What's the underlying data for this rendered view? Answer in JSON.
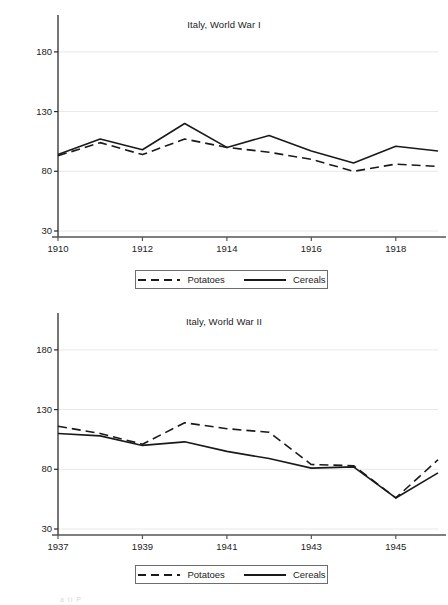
{
  "figure": {
    "background_color": "#ffffff",
    "line_color": "#1a1a1a",
    "grid_color": "#e8e8e8",
    "axis_color": "#555555",
    "footer_artifact": "a    ti    P"
  },
  "legend": {
    "series": [
      {
        "name": "Potatoes",
        "style": "dashed"
      },
      {
        "name": "Cereals",
        "style": "solid"
      }
    ]
  },
  "chart_data": [
    {
      "id": "italy-world-war-1",
      "type": "line",
      "title": "Italy, World War I",
      "xlabel": "",
      "ylabel": "",
      "xlim": [
        1910,
        1919
      ],
      "ylim": [
        30,
        200
      ],
      "yticks": [
        30,
        80,
        130,
        180
      ],
      "ytick_labels": [
        "30",
        "80",
        "130",
        "180"
      ],
      "xticks": [
        1910,
        1912,
        1914,
        1916,
        1918
      ],
      "xtick_labels": [
        "1910",
        "1912",
        "1914",
        "1916",
        "1918"
      ],
      "x": [
        1910,
        1911,
        1912,
        1913,
        1914,
        1915,
        1916,
        1917,
        1918,
        1919
      ],
      "grid": "horizontal",
      "legend_position": "below",
      "series": [
        {
          "name": "Potatoes",
          "style": "dashed",
          "values": [
            93,
            104,
            94,
            107,
            100,
            96,
            90,
            80,
            86,
            84
          ]
        },
        {
          "name": "Cereals",
          "style": "solid",
          "values": [
            94,
            107,
            98,
            120,
            100,
            110,
            97,
            87,
            101,
            97
          ]
        }
      ]
    },
    {
      "id": "italy-world-war-2",
      "type": "line",
      "title": "Italy, World War II",
      "xlabel": "",
      "ylabel": "",
      "xlim": [
        1937,
        1946
      ],
      "ylim": [
        30,
        200
      ],
      "yticks": [
        30,
        80,
        130,
        180
      ],
      "ytick_labels": [
        "30",
        "80",
        "130",
        "180"
      ],
      "xticks": [
        1937,
        1939,
        1941,
        1943,
        1945
      ],
      "xtick_labels": [
        "1937",
        "1939",
        "1941",
        "1943",
        "1945"
      ],
      "x": [
        1937,
        1938,
        1939,
        1940,
        1941,
        1942,
        1943,
        1944,
        1945,
        1946
      ],
      "grid": "horizontal",
      "legend_position": "below",
      "series": [
        {
          "name": "Potatoes",
          "style": "dashed",
          "values": [
            116,
            110,
            101,
            119,
            114,
            111,
            84,
            83,
            56,
            88
          ]
        },
        {
          "name": "Cereals",
          "style": "solid",
          "values": [
            110,
            108,
            100,
            103,
            95,
            89,
            81,
            82,
            56,
            77
          ]
        }
      ]
    }
  ]
}
